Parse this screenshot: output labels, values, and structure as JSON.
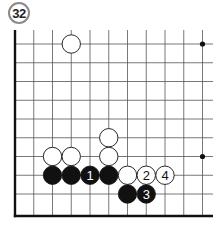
{
  "diagram": {
    "number": "32",
    "board": {
      "type": "go-board-corner",
      "columns": 11,
      "rows": 10,
      "edges": [
        "left",
        "bottom"
      ],
      "star_points": [
        [
          10,
          0
        ],
        [
          10,
          6
        ]
      ]
    },
    "stones": [
      {
        "col": 3,
        "row": 0,
        "color": "white",
        "label": ""
      },
      {
        "col": 5,
        "row": 5,
        "color": "white",
        "label": ""
      },
      {
        "col": 2,
        "row": 6,
        "color": "white",
        "label": ""
      },
      {
        "col": 3,
        "row": 6,
        "color": "white",
        "label": ""
      },
      {
        "col": 5,
        "row": 6,
        "color": "white",
        "label": ""
      },
      {
        "col": 2,
        "row": 7,
        "color": "black",
        "label": ""
      },
      {
        "col": 3,
        "row": 7,
        "color": "black",
        "label": ""
      },
      {
        "col": 4,
        "row": 7,
        "color": "black",
        "label": "1"
      },
      {
        "col": 5,
        "row": 7,
        "color": "black",
        "label": ""
      },
      {
        "col": 6,
        "row": 7,
        "color": "white",
        "label": ""
      },
      {
        "col": 7,
        "row": 7,
        "color": "white",
        "label": "2"
      },
      {
        "col": 8,
        "row": 7,
        "color": "white",
        "label": "4"
      },
      {
        "col": 6,
        "row": 8,
        "color": "black",
        "label": ""
      },
      {
        "col": 7,
        "row": 8,
        "color": "black",
        "label": "3"
      }
    ]
  }
}
